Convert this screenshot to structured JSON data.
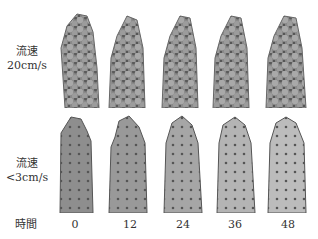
{
  "rows": [
    {
      "label_line1": "流速",
      "label_line2": "20cm/s"
    },
    {
      "label_line1": "流速",
      "label_line2": "<3cm/s"
    }
  ],
  "time_axis": {
    "label": "時間",
    "ticks": [
      "0",
      "12",
      "24",
      "36",
      "48"
    ]
  }
}
